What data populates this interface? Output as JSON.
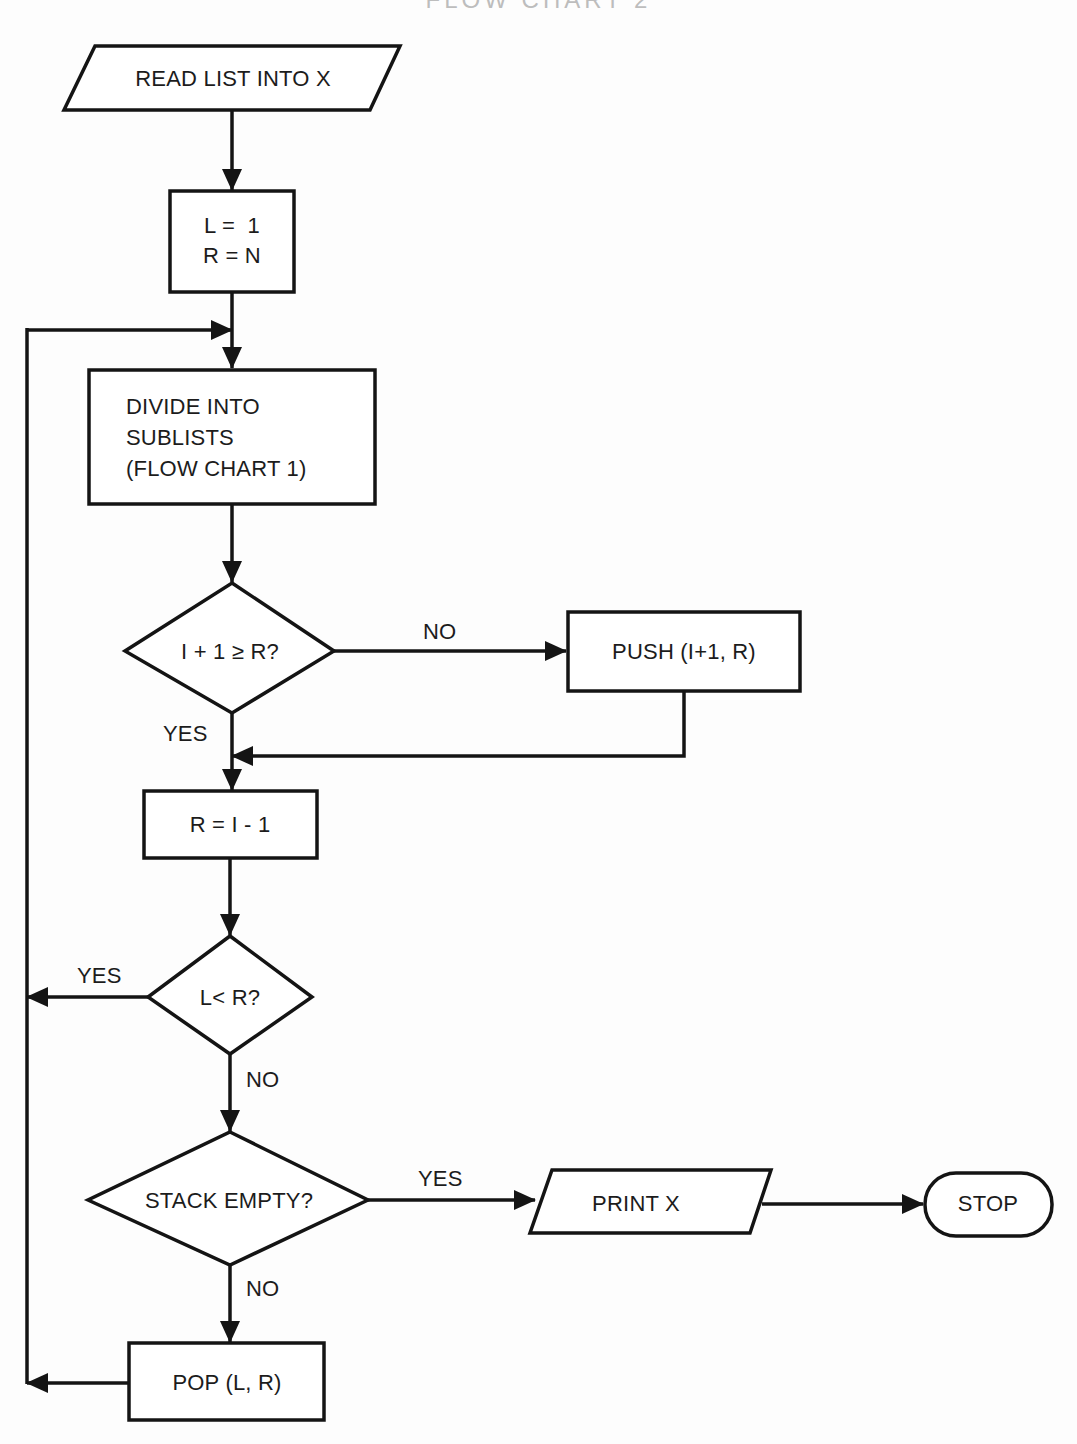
{
  "diagram": {
    "title_partial": "FLOW CHART 2",
    "nodes": {
      "read": {
        "type": "io",
        "label": "READ LIST INTO X"
      },
      "init": {
        "type": "process",
        "lines": [
          "L =  1",
          "R = N"
        ]
      },
      "divide": {
        "type": "process",
        "lines": [
          "DIVIDE INTO",
          "SUBLISTS",
          "(FLOW CHART 1)"
        ]
      },
      "test1": {
        "type": "decision",
        "label": "I + 1 ≥ R?"
      },
      "push": {
        "type": "process",
        "label": "PUSH (I+1, R)"
      },
      "assign": {
        "type": "process",
        "label": "R = I - 1"
      },
      "test2": {
        "type": "decision",
        "label": "L< R?"
      },
      "test3": {
        "type": "decision",
        "label": "STACK EMPTY?"
      },
      "print": {
        "type": "io",
        "label": "PRINT X"
      },
      "stop": {
        "type": "terminal",
        "label": "STOP"
      },
      "pop": {
        "type": "process",
        "label": "POP (L, R)"
      }
    },
    "edge_labels": {
      "test1_no": "NO",
      "test1_yes": "YES",
      "test2_yes": "YES",
      "test2_no": "NO",
      "test3_yes": "YES",
      "test3_no": "NO"
    },
    "edges": [
      {
        "from": "read",
        "to": "init"
      },
      {
        "from": "init",
        "to": "divide"
      },
      {
        "from": "divide",
        "to": "test1"
      },
      {
        "from": "test1",
        "to": "push",
        "label": "NO"
      },
      {
        "from": "test1",
        "to": "assign",
        "label": "YES"
      },
      {
        "from": "push",
        "to": "assign"
      },
      {
        "from": "assign",
        "to": "test2"
      },
      {
        "from": "test2",
        "to": "divide",
        "label": "YES"
      },
      {
        "from": "test2",
        "to": "test3",
        "label": "NO"
      },
      {
        "from": "test3",
        "to": "print",
        "label": "YES"
      },
      {
        "from": "test3",
        "to": "pop",
        "label": "NO"
      },
      {
        "from": "print",
        "to": "stop"
      },
      {
        "from": "pop",
        "to": "divide"
      }
    ],
    "colors": {
      "stroke": "#141414",
      "background": "#fdfdfd",
      "text": "#1c1c1c"
    }
  }
}
